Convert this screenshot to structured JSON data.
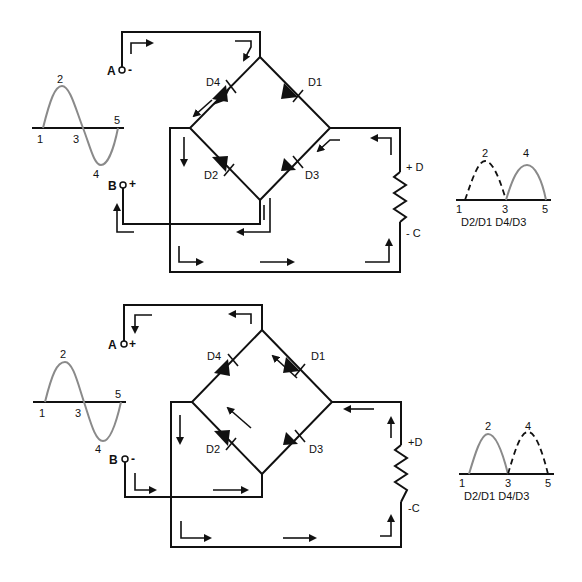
{
  "diagram": {
    "type": "full-wave bridge rectifier current flow",
    "panels": [
      {
        "id": "top",
        "terminal_a": {
          "letter": "A",
          "polarity": "-"
        },
        "terminal_b": {
          "letter": "B",
          "polarity": "+"
        },
        "diodes": [
          "D4",
          "D1",
          "D2",
          "D3"
        ],
        "load": {
          "top": "+ D",
          "bottom": "- C"
        },
        "input_wave": {
          "points": [
            "1",
            "2",
            "3",
            "4",
            "5"
          ]
        },
        "output_wave": {
          "points": [
            "1",
            "2",
            "3",
            "4",
            "5"
          ],
          "caption": "D2/D1 D4/D3",
          "active_half": "4",
          "dashed_half": "2"
        }
      },
      {
        "id": "bottom",
        "terminal_a": {
          "letter": "A",
          "polarity": "+"
        },
        "terminal_b": {
          "letter": "B",
          "polarity": "-"
        },
        "diodes": [
          "D4",
          "D1",
          "D2",
          "D3"
        ],
        "load": {
          "top": "+D",
          "bottom": "-C"
        },
        "input_wave": {
          "points": [
            "1",
            "2",
            "3",
            "4",
            "5"
          ]
        },
        "output_wave": {
          "points": [
            "1",
            "2",
            "3",
            "4",
            "5"
          ],
          "caption": "D2/D1 D4/D3",
          "active_half": "2",
          "dashed_half": "4"
        }
      }
    ]
  },
  "colors": {
    "line": "#111111",
    "wave": "#8a8a8a",
    "background": "#ffffff"
  }
}
